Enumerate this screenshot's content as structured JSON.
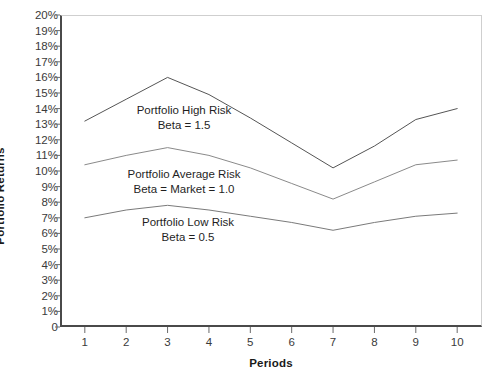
{
  "chart_data": {
    "type": "line",
    "title": "",
    "xlabel": "Periods",
    "ylabel": "Portfolio Returns",
    "xlim": [
      0.4,
      10.6
    ],
    "ylim": [
      0,
      20
    ],
    "grid": false,
    "legend_position": "inline-annotations",
    "x": [
      1,
      2,
      3,
      4,
      5,
      6,
      7,
      8,
      9,
      10
    ],
    "x_tick_labels": [
      "1",
      "2",
      "3",
      "4",
      "5",
      "6",
      "7",
      "8",
      "9",
      "10"
    ],
    "y_tick_labels": [
      "20%",
      "19%",
      "18%",
      "17%",
      "16%",
      "15%",
      "14%",
      "13%",
      "12%",
      "11%",
      "10%",
      "9%",
      "8%",
      "7%",
      "6%",
      "5%",
      "4%",
      "3%",
      "2%",
      "1%",
      "0"
    ],
    "y_tick_values": [
      20,
      19,
      18,
      17,
      16,
      15,
      14,
      13,
      12,
      11,
      10,
      9,
      8,
      7,
      6,
      5,
      4,
      3,
      2,
      1,
      0
    ],
    "series": [
      {
        "name": "Portfolio High Risk",
        "beta_label": "Beta = 1.5",
        "color": "#555555",
        "values": [
          13.2,
          14.6,
          16.0,
          14.9,
          13.4,
          11.8,
          10.2,
          11.6,
          13.3,
          14.0
        ]
      },
      {
        "name": "Portfolio Average Risk",
        "beta_label": "Beta = Market = 1.0",
        "color": "#8a8a8a",
        "values": [
          10.4,
          11.0,
          11.5,
          11.0,
          10.2,
          9.2,
          8.2,
          9.3,
          10.4,
          10.7
        ]
      },
      {
        "name": "Portfolio Low Risk",
        "beta_label": "Beta = 0.5",
        "color": "#7a7a7a",
        "values": [
          7.0,
          7.5,
          7.8,
          7.5,
          7.1,
          6.7,
          6.2,
          6.7,
          7.1,
          7.3
        ]
      }
    ],
    "annotations": [
      {
        "line1": "Portfolio High Risk",
        "line2": "Beta = 1.5",
        "x_px": 184,
        "y_px": 103
      },
      {
        "line1": "Portfolio Average Risk",
        "line2": "Beta = Market = 1.0",
        "x_px": 184,
        "y_px": 167
      },
      {
        "line1": "Portfolio Low Risk",
        "line2": "Beta = 0.5",
        "x_px": 188,
        "y_px": 215
      }
    ]
  }
}
